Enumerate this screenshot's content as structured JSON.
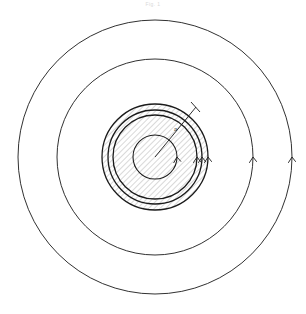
{
  "figure": {
    "caption": "Fig. 1",
    "background_color": "#ffffff",
    "line_color": "#1a1a1a",
    "hatch_color": "#9a9a9a",
    "center": {
      "x": 155,
      "y": 157
    },
    "labels": [
      {
        "id": "radius-label-a",
        "text": "a",
        "x": 178,
        "y": 128
      }
    ],
    "radius_line": {
      "name": "radius-a",
      "from": {
        "x": 155,
        "y": 157
      },
      "to": {
        "x": 196,
        "y": 107
      },
      "label": "a"
    },
    "circles": [
      {
        "id": "circle-outer",
        "r": 137,
        "stroke_width": 0.9,
        "hatched": false,
        "arrow": true
      },
      {
        "id": "circle-second",
        "r": 98,
        "stroke_width": 0.9,
        "hatched": false,
        "arrow": true
      },
      {
        "id": "circle-shell-outer",
        "r": 53,
        "stroke_width": 1.3,
        "hatched": true,
        "arrow": true
      },
      {
        "id": "circle-shell-mid",
        "r": 47,
        "stroke_width": 1.3,
        "hatched": true,
        "arrow": true
      },
      {
        "id": "circle-shell-inner",
        "r": 42,
        "stroke_width": 1.3,
        "hatched": true,
        "arrow": true
      },
      {
        "id": "circle-core",
        "r": 22,
        "stroke_width": 1.1,
        "hatched": true,
        "arrow": true
      }
    ],
    "arrows": {
      "direction": "counterclockwise",
      "placement": "right-horizontal-axis",
      "count": 6
    }
  },
  "chart_data": {
    "type": "diagram",
    "title": "Fig. 1",
    "units": "arbitrary",
    "center": [
      155,
      157
    ],
    "series": [
      {
        "name": "outer field line",
        "radius": 137,
        "hatched": false,
        "arrow_direction": "counterclockwise"
      },
      {
        "name": "middle field line",
        "radius": 98,
        "hatched": false,
        "arrow_direction": "counterclockwise"
      },
      {
        "name": "shell outer boundary",
        "radius": 53,
        "hatched": true,
        "arrow_direction": "counterclockwise"
      },
      {
        "name": "shell middle boundary",
        "radius": 47,
        "hatched": true,
        "arrow_direction": "counterclockwise"
      },
      {
        "name": "shell inner boundary",
        "radius": 42,
        "hatched": true,
        "arrow_direction": "counterclockwise"
      },
      {
        "name": "core boundary",
        "radius": 22,
        "hatched": true,
        "arrow_direction": "counterclockwise"
      }
    ],
    "annotations": [
      {
        "label": "a",
        "type": "radius",
        "value": 53,
        "angle_deg": 50
      }
    ],
    "legend": "none",
    "grid": false
  }
}
